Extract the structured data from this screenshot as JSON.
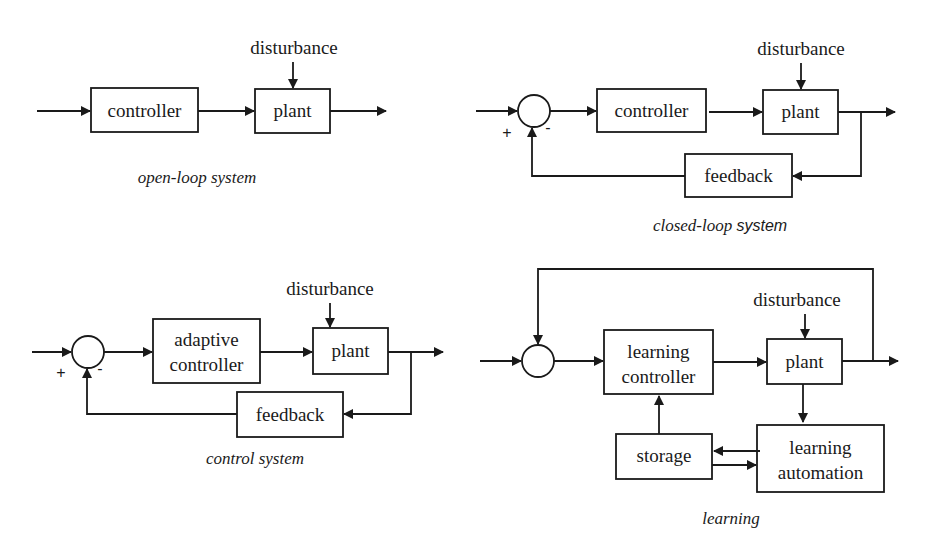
{
  "diagrams": {
    "open_loop": {
      "controller": "controller",
      "plant": "plant",
      "disturbance": "disturbance",
      "caption": "open-loop system"
    },
    "closed_loop": {
      "controller": "controller",
      "plant": "plant",
      "feedback": "feedback",
      "disturbance": "disturbance",
      "plus": "+",
      "minus": "-",
      "caption_part1": "closed-loop ",
      "caption_part2": "system"
    },
    "control_system": {
      "controller_line1": "adaptive",
      "controller_line2": "controller",
      "plant": "plant",
      "feedback": "feedback",
      "disturbance": "disturbance",
      "plus": "+",
      "minus": "-",
      "caption": "control system"
    },
    "learning": {
      "controller_line1": "learning",
      "controller_line2": "controller",
      "plant": "plant",
      "disturbance": "disturbance",
      "storage": "storage",
      "automation_line1": "learning",
      "automation_line2": "automation",
      "caption": "learning"
    }
  }
}
